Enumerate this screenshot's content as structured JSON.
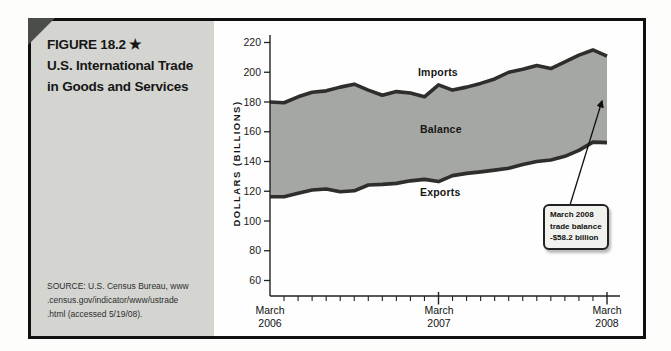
{
  "figure": {
    "label": "FIGURE 18.2",
    "star": "★",
    "title_lines": [
      "U.S. International Trade",
      "in Goods and Services"
    ],
    "source_lines": [
      "SOURCE: U.S. Census Bureau, www",
      ".census.gov/indicator/www/ustrade",
      ".html (accessed 5/19/08)."
    ]
  },
  "chart_data": {
    "type": "area",
    "title": "U.S. International Trade in Goods and Services",
    "xlabel": "",
    "ylabel": "DOLLARS (BILLIONS)",
    "ylim": [
      60,
      220
    ],
    "yticks": [
      60,
      80,
      100,
      120,
      140,
      160,
      180,
      200,
      220
    ],
    "grid": false,
    "legend_position": "inline-labels",
    "categories": [
      "Mar 2006",
      "Apr 2006",
      "May 2006",
      "Jun 2006",
      "Jul 2006",
      "Aug 2006",
      "Sep 2006",
      "Oct 2006",
      "Nov 2006",
      "Dec 2006",
      "Jan 2007",
      "Feb 2007",
      "Mar 2007",
      "Apr 2007",
      "May 2007",
      "Jun 2007",
      "Jul 2007",
      "Aug 2007",
      "Sep 2007",
      "Oct 2007",
      "Nov 2007",
      "Dec 2007",
      "Jan 2008",
      "Feb 2008",
      "Mar 2008"
    ],
    "x_major_tick_indices": [
      0,
      12,
      24
    ],
    "x_major_tick_labels": [
      "March 2006",
      "March 2007",
      "March 2008"
    ],
    "series": [
      {
        "name": "Imports",
        "values": [
          180.0,
          179.5,
          183.5,
          186.5,
          187.5,
          190.0,
          192.0,
          188.0,
          184.5,
          187.0,
          186.0,
          183.5,
          191.5,
          188.0,
          190.0,
          192.5,
          195.5,
          200.0,
          202.0,
          204.5,
          202.5,
          207.0,
          211.5,
          215.0,
          210.9
        ]
      },
      {
        "name": "Exports",
        "values": [
          116.3,
          116.3,
          118.6,
          120.8,
          121.5,
          119.7,
          120.3,
          124.2,
          124.6,
          125.3,
          127.0,
          128.0,
          126.5,
          130.5,
          132.0,
          133.0,
          134.2,
          135.5,
          138.0,
          140.0,
          141.0,
          143.5,
          147.5,
          153.0,
          152.7
        ]
      }
    ],
    "band_label": "Balance",
    "annotation": {
      "lines": [
        "March 2008",
        "trade balance",
        "-$58.2 billion"
      ],
      "value_billions": -58.2
    },
    "colors": {
      "band": "#a5a7a3",
      "series_line": "#2e2e2c",
      "axis": "#222222",
      "sidebar_bg": "#d4d5d1",
      "frame_border": "#101010"
    }
  }
}
